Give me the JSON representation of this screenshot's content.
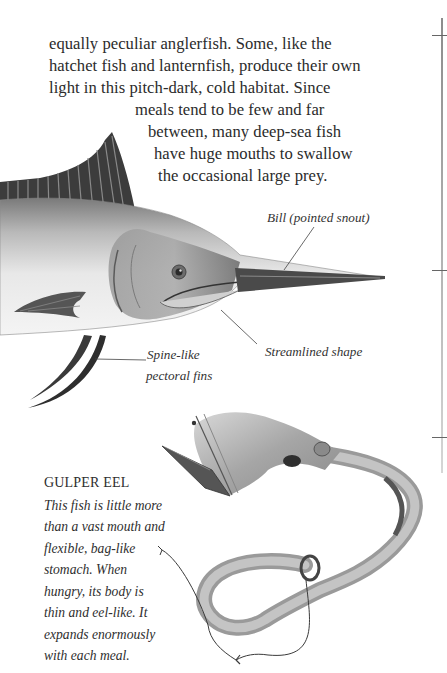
{
  "body_text": {
    "lines": [
      "equally peculiar anglerfish. Some, like the",
      "hatchet fish and lanternfish, produce their own",
      "light in this pitch-dark, cold habitat. Since",
      "meals tend to be few and far",
      "between, many deep-sea fish",
      "have huge mouths to swallow",
      "the occasional large prey."
    ]
  },
  "swordfish": {
    "labels": {
      "bill": "Bill (pointed snout)",
      "streamlined": "Streamlined shape",
      "fins_line1": "Spine-like",
      "fins_line2": "pectoral fins"
    }
  },
  "gulper_eel": {
    "title": "GULPER EEL",
    "caption_lines": [
      "This fish is little more",
      "than a vast mouth and",
      "flexible, bag-like",
      "stomach. When",
      "hungry, its body is",
      "thin and eel-like. It",
      "expands enormously",
      "with each meal."
    ]
  },
  "colors": {
    "text": "#2b2b2b",
    "rule": "#8c8c8c",
    "fish_dark": "#2f2f2f",
    "fish_mid": "#8a8a8a",
    "fish_light": "#e6e6e6"
  }
}
